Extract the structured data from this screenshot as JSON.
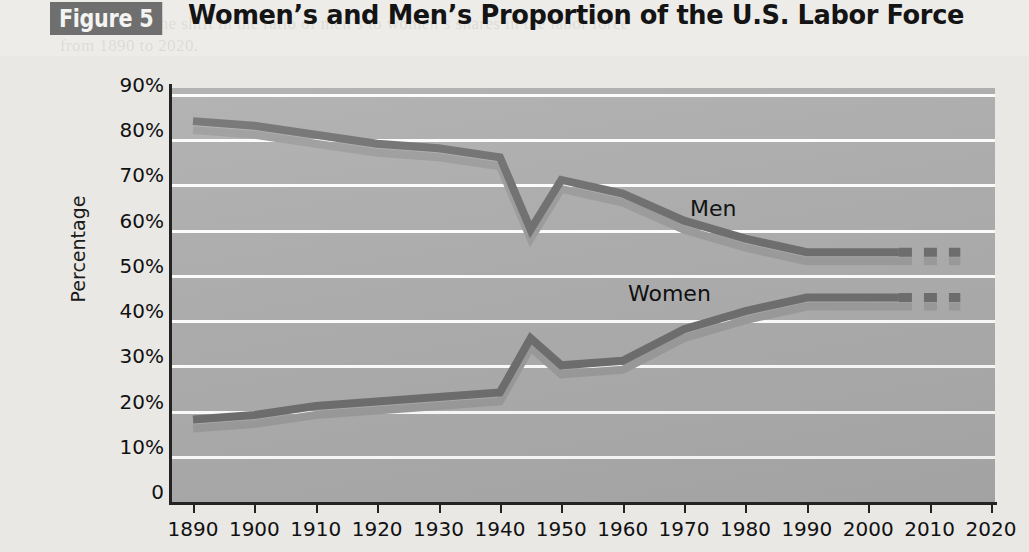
{
  "header": {
    "figure_badge": "Figure 5",
    "title": "Women’s and Men’s Proportion of the U.S. Labor Force"
  },
  "colors": {
    "plot_background": "#ababab",
    "gridline": "#fbfbfa",
    "axis": "#232323",
    "series_line": "#6e6e6e",
    "series_shadow": "#9a9a9a",
    "badge_background": "#6f6f6f",
    "page_background": "#e9e8e5"
  },
  "annotations": [
    {
      "name": "men-label",
      "text": "Men",
      "x": 690,
      "y": 196
    },
    {
      "name": "women-label",
      "text": "Women",
      "x": 628,
      "y": 281
    }
  ],
  "bleed_text": [
    {
      "text": "graphs show the shift in the ratio of men’s to women’s shares in the labor force",
      "x": 60,
      "y": 14
    },
    {
      "text": "from 1890 to 2020.",
      "x": 60,
      "y": 36
    },
    {
      "text": "women have entered the labor force in increasing numbers since 1900",
      "x": 205,
      "y": 66
    },
    {
      "text": "and the proportion of men in the labor force has",
      "x": 205,
      "y": 92
    },
    {
      "text": "declined steadily, while the share held by women",
      "x": 205,
      "y": 118
    },
    {
      "text": "has grown, projections to 2020 indicate that",
      "x": 205,
      "y": 144
    },
    {
      "text": "the two lines may continue to converge",
      "x": 205,
      "y": 172
    },
    {
      "text": "by 2020 the proportions are expected to be",
      "x": 205,
      "y": 200
    },
    {
      "text": "about 55 percent for men and 45 percent",
      "x": 205,
      "y": 232
    },
    {
      "text": "for women in the U.S. labor force overall",
      "x": 205,
      "y": 262
    },
    {
      "text": "compared with the 1890 figures of 84 and 18",
      "x": 205,
      "y": 296
    },
    {
      "text": "percent, this represents a substantial change",
      "x": 205,
      "y": 330
    },
    {
      "text": "in the composition of the American workforce",
      "x": 205,
      "y": 362
    },
    {
      "text": "over the course of more than a century of",
      "x": 205,
      "y": 394
    },
    {
      "text": "economic and social transformation",
      "x": 205,
      "y": 424
    }
  ],
  "chart_data": {
    "type": "line",
    "title": "Women’s and Men’s Proportion of the U.S. Labor Force",
    "xlabel": "Year",
    "ylabel": "Percentage",
    "xlim": [
      1890,
      2020
    ],
    "ylim": [
      0,
      90
    ],
    "grid": true,
    "legend_position": "inline-annotation",
    "y_ticks": [
      {
        "value": 90,
        "label": "90%"
      },
      {
        "value": 80,
        "label": "80%"
      },
      {
        "value": 70,
        "label": "70%"
      },
      {
        "value": 60,
        "label": "60%"
      },
      {
        "value": 50,
        "label": "50%"
      },
      {
        "value": 40,
        "label": "40%"
      },
      {
        "value": 30,
        "label": "30%"
      },
      {
        "value": 20,
        "label": "20%"
      },
      {
        "value": 10,
        "label": "10%"
      },
      {
        "value": 0,
        "label": "0"
      }
    ],
    "x_ticks": [
      {
        "value": 1890,
        "label": "1890"
      },
      {
        "value": 1900,
        "label": "1900"
      },
      {
        "value": 1910,
        "label": "1910"
      },
      {
        "value": 1920,
        "label": "1920"
      },
      {
        "value": 1930,
        "label": "1930"
      },
      {
        "value": 1940,
        "label": "1940"
      },
      {
        "value": 1950,
        "label": "1950"
      },
      {
        "value": 1960,
        "label": "1960"
      },
      {
        "value": 1970,
        "label": "1970"
      },
      {
        "value": 1980,
        "label": "1980"
      },
      {
        "value": 1990,
        "label": "1990"
      },
      {
        "value": 2000,
        "label": "2000"
      },
      {
        "value": 2010,
        "label": "2010"
      },
      {
        "value": 2020,
        "label": "2020"
      }
    ],
    "series": [
      {
        "name": "Men",
        "label": "Men",
        "solid_points": [
          {
            "x": 1890,
            "y": 84
          },
          {
            "x": 1900,
            "y": 83
          },
          {
            "x": 1910,
            "y": 81
          },
          {
            "x": 1920,
            "y": 79
          },
          {
            "x": 1930,
            "y": 78
          },
          {
            "x": 1940,
            "y": 76
          },
          {
            "x": 1945,
            "y": 60
          },
          {
            "x": 1950,
            "y": 71
          },
          {
            "x": 1960,
            "y": 68
          },
          {
            "x": 1970,
            "y": 62
          },
          {
            "x": 1980,
            "y": 58
          },
          {
            "x": 1990,
            "y": 55
          },
          {
            "x": 2000,
            "y": 55
          },
          {
            "x": 2005,
            "y": 55
          }
        ],
        "projected_points": [
          {
            "x": 2005,
            "y": 55
          },
          {
            "x": 2015,
            "y": 55
          }
        ]
      },
      {
        "name": "Women",
        "label": "Women",
        "solid_points": [
          {
            "x": 1890,
            "y": 18
          },
          {
            "x": 1900,
            "y": 19
          },
          {
            "x": 1910,
            "y": 21
          },
          {
            "x": 1920,
            "y": 22
          },
          {
            "x": 1930,
            "y": 23
          },
          {
            "x": 1940,
            "y": 24
          },
          {
            "x": 1945,
            "y": 36
          },
          {
            "x": 1950,
            "y": 30
          },
          {
            "x": 1960,
            "y": 31
          },
          {
            "x": 1970,
            "y": 38
          },
          {
            "x": 1980,
            "y": 42
          },
          {
            "x": 1990,
            "y": 45
          },
          {
            "x": 2000,
            "y": 45
          },
          {
            "x": 2005,
            "y": 45
          }
        ],
        "projected_points": [
          {
            "x": 2005,
            "y": 45
          },
          {
            "x": 2015,
            "y": 45
          }
        ]
      }
    ]
  }
}
